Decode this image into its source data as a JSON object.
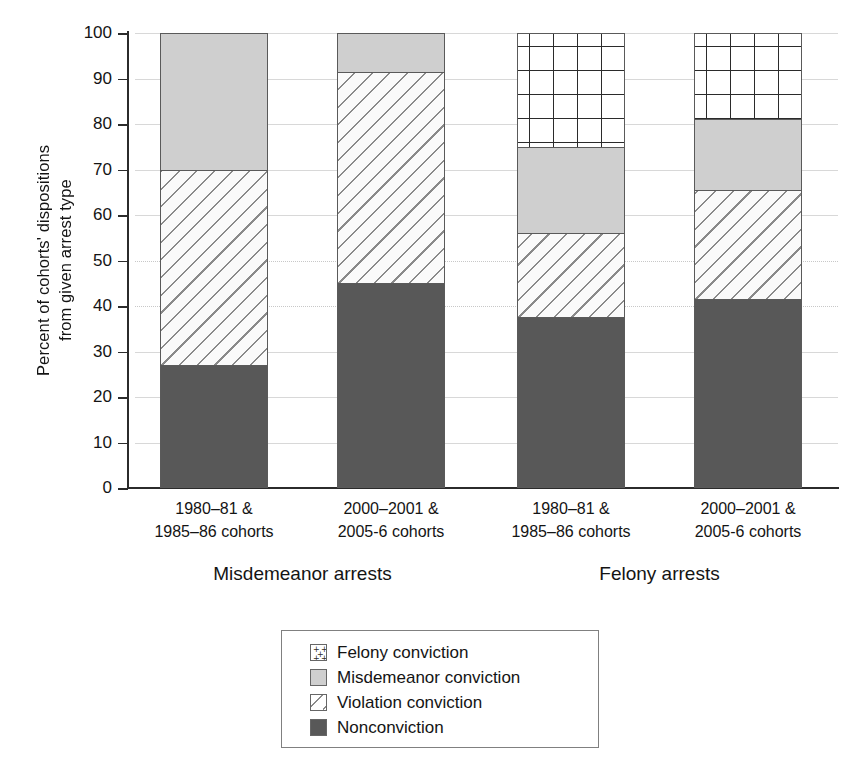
{
  "axes": {
    "ylabel_line1": "Percent of cohorts' dispositions",
    "ylabel_line2": "from given arrest type",
    "yticks": [
      "100",
      "90",
      "80",
      "70",
      "60",
      "50",
      "40",
      "30",
      "20",
      "10",
      "0"
    ]
  },
  "xlabels": [
    {
      "line1": "1980–81 &",
      "line2": "1985–86 cohorts"
    },
    {
      "line1": "2000–2001 &",
      "line2": "2005-6 cohorts"
    },
    {
      "line1": "1980–81 &",
      "line2": "1985–86 cohorts"
    },
    {
      "line1": "2000–2001 &",
      "line2": "2005-6 cohorts"
    }
  ],
  "grouplabels": [
    "Misdemeanor arrests",
    "Felony arrests"
  ],
  "legend": {
    "items": [
      {
        "label": "Felony conviction",
        "key": "felony",
        "color": "#ffffff"
      },
      {
        "label": "Misdemeanor conviction",
        "key": "misdemeanor",
        "color": "#cfcfcf"
      },
      {
        "label": "Violation conviction",
        "key": "violation",
        "color": "#fafafa"
      },
      {
        "label": "Nonconviction",
        "key": "nonconviction",
        "color": "#585858"
      }
    ]
  },
  "chart_data": {
    "type": "bar",
    "subtype": "stacked-bar-100-percent",
    "title": "",
    "xlabel": "",
    "ylabel": "Percent of cohorts' dispositions from given arrest type",
    "ylim": [
      0,
      100
    ],
    "ytick_step": 10,
    "grid": true,
    "legend_position": "bottom-center",
    "groups": [
      "Misdemeanor arrests",
      "Felony arrests"
    ],
    "categories": [
      "Misdemeanor arrests / 1980–81 & 1985–86 cohorts",
      "Misdemeanor arrests / 2000–2001 & 2005-6 cohorts",
      "Felony arrests / 1980–81 & 1985–86 cohorts",
      "Felony arrests / 2000–2001 & 2005-6 cohorts"
    ],
    "series": [
      {
        "name": "Nonconviction",
        "values": [
          27,
          45,
          37.5,
          41.5
        ],
        "pattern": "solid-dark-gray",
        "color": "#585858"
      },
      {
        "name": "Violation conviction",
        "values": [
          43,
          46.5,
          18.5,
          24
        ],
        "pattern": "diagonal-hatch",
        "color": "#fafafa"
      },
      {
        "name": "Misdemeanor conviction",
        "values": [
          30,
          8.5,
          19,
          15.5
        ],
        "pattern": "solid-light-gray",
        "color": "#cfcfcf"
      },
      {
        "name": "Felony conviction",
        "values": [
          0,
          0,
          25,
          19
        ],
        "pattern": "plus-signs",
        "color": "#ffffff"
      }
    ],
    "cumulative_tops": {
      "Nonconviction": [
        27,
        45,
        37.5,
        41.5
      ],
      "Violation conviction": [
        70,
        91.5,
        56,
        65.5
      ],
      "Misdemeanor conviction": [
        100,
        100,
        75,
        81
      ],
      "Felony conviction": [
        100,
        100,
        100,
        100
      ]
    }
  }
}
